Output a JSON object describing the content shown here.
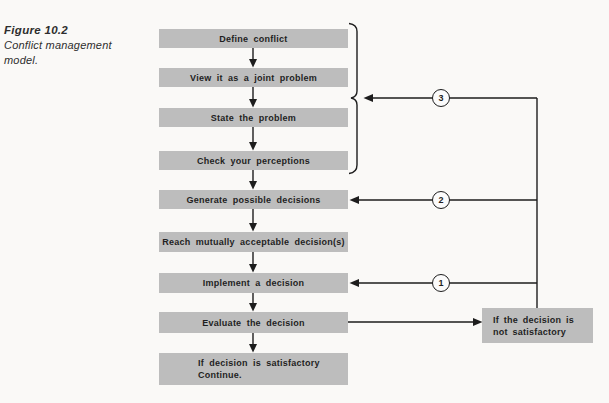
{
  "caption": {
    "label": "Figure 10.2",
    "line1": "Conflict management",
    "line2": "model."
  },
  "steps": [
    {
      "label": "Define conflict"
    },
    {
      "label": "View it as a joint problem"
    },
    {
      "label": "State the problem"
    },
    {
      "label": "Check your perceptions"
    },
    {
      "label": "Generate possible decisions"
    },
    {
      "label": "Reach mutually acceptable decision(s)"
    },
    {
      "label": "Implement a decision"
    },
    {
      "label": "Evaluate the decision"
    }
  ],
  "final_step": {
    "line1": "If decision is satisfactory",
    "line2": "Continue."
  },
  "side_box": {
    "line1": "If the decision is",
    "line2": "not satisfactory"
  },
  "loop_markers": {
    "top": "3",
    "middle": "2",
    "bottom": "1"
  },
  "colors": {
    "bg": "#faf9f7",
    "box_fill": "#bdbdbd",
    "line": "#1d1d1d",
    "text": "#1f1f1f",
    "circle_fill": "#fbfbfb"
  }
}
